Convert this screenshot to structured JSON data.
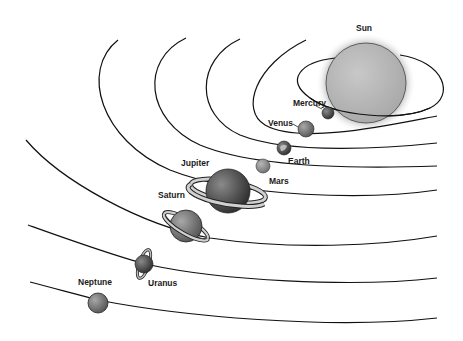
{
  "diagram": {
    "colors": {
      "background": "#ffffff",
      "orbit": "#111111",
      "sun": "#b5b5b5",
      "sun_glow": "#8a8a8a",
      "planet_dark": "#4a4a4a",
      "planet_mid": "#7a7a7a",
      "planet_light": "#9a9a9a"
    },
    "bodies": [
      {
        "name": "Sun",
        "label": "Sun"
      },
      {
        "name": "Mercury",
        "label": "Mercury"
      },
      {
        "name": "Venus",
        "label": "Venus"
      },
      {
        "name": "Earth",
        "label": "Earth"
      },
      {
        "name": "Mars",
        "label": "Mars"
      },
      {
        "name": "Jupiter",
        "label": "Jupiter"
      },
      {
        "name": "Saturn",
        "label": "Saturn"
      },
      {
        "name": "Uranus",
        "label": "Uranus"
      },
      {
        "name": "Neptune",
        "label": "Neptune"
      }
    ]
  }
}
